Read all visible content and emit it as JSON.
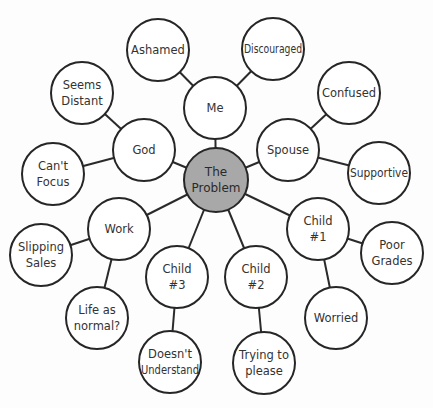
{
  "diagram": {
    "type": "mind-map",
    "center": {
      "id": "problem",
      "lines": [
        "The",
        "Problem"
      ],
      "x": 216,
      "y": 180,
      "r": 32,
      "fill": "#a8a8a8"
    },
    "nodes": [
      {
        "id": "me",
        "lines": [
          "Me"
        ],
        "x": 215,
        "y": 108,
        "r": 31
      },
      {
        "id": "god",
        "lines": [
          "God"
        ],
        "x": 144,
        "y": 150,
        "r": 31
      },
      {
        "id": "spouse",
        "lines": [
          "Spouse"
        ],
        "x": 288,
        "y": 150,
        "r": 31
      },
      {
        "id": "work",
        "lines": [
          "Work"
        ],
        "x": 119,
        "y": 229,
        "r": 31
      },
      {
        "id": "child1",
        "lines": [
          "Child",
          "#1"
        ],
        "x": 318,
        "y": 229,
        "r": 31
      },
      {
        "id": "child3",
        "lines": [
          "Child",
          "#3"
        ],
        "x": 177,
        "y": 277,
        "r": 31
      },
      {
        "id": "child2",
        "lines": [
          "Child",
          "#2"
        ],
        "x": 256,
        "y": 277,
        "r": 31
      },
      {
        "id": "ashamed",
        "lines": [
          "Ashamed"
        ],
        "x": 158,
        "y": 50,
        "r": 31
      },
      {
        "id": "discouraged",
        "lines": [
          "Discouraged"
        ],
        "x": 273,
        "y": 49,
        "r": 31
      },
      {
        "id": "seems-distant",
        "lines": [
          "Seems",
          "Distant"
        ],
        "x": 82,
        "y": 93,
        "r": 31
      },
      {
        "id": "cant-focus",
        "lines": [
          "Can't",
          "Focus"
        ],
        "x": 53,
        "y": 174,
        "r": 31
      },
      {
        "id": "confused",
        "lines": [
          "Confused"
        ],
        "x": 349,
        "y": 93,
        "r": 31
      },
      {
        "id": "supportive",
        "lines": [
          "Supportive"
        ],
        "x": 379,
        "y": 173,
        "r": 31
      },
      {
        "id": "slipping-sales",
        "lines": [
          "Slipping",
          "Sales"
        ],
        "x": 41,
        "y": 255,
        "r": 31
      },
      {
        "id": "life-as-normal",
        "lines": [
          "Life as",
          "normal?"
        ],
        "x": 97,
        "y": 318,
        "r": 31
      },
      {
        "id": "doesnt-understand",
        "lines": [
          "Doesn't",
          "Understand"
        ],
        "x": 170,
        "y": 362,
        "r": 31
      },
      {
        "id": "trying-to-please",
        "lines": [
          "Trying to",
          "please"
        ],
        "x": 264,
        "y": 363,
        "r": 31
      },
      {
        "id": "worried",
        "lines": [
          "Worried"
        ],
        "x": 336,
        "y": 318,
        "r": 31
      },
      {
        "id": "poor-grades",
        "lines": [
          "Poor",
          "Grades"
        ],
        "x": 392,
        "y": 253,
        "r": 31
      }
    ],
    "edges": [
      [
        "problem",
        "me"
      ],
      [
        "problem",
        "god"
      ],
      [
        "problem",
        "spouse"
      ],
      [
        "problem",
        "work"
      ],
      [
        "problem",
        "child1"
      ],
      [
        "problem",
        "child3"
      ],
      [
        "problem",
        "child2"
      ],
      [
        "me",
        "ashamed"
      ],
      [
        "me",
        "discouraged"
      ],
      [
        "god",
        "seems-distant"
      ],
      [
        "god",
        "cant-focus"
      ],
      [
        "spouse",
        "confused"
      ],
      [
        "spouse",
        "supportive"
      ],
      [
        "work",
        "slipping-sales"
      ],
      [
        "work",
        "life-as-normal"
      ],
      [
        "child3",
        "doesnt-understand"
      ],
      [
        "child2",
        "trying-to-please"
      ],
      [
        "child1",
        "worried"
      ],
      [
        "child1",
        "poor-grades"
      ]
    ]
  }
}
